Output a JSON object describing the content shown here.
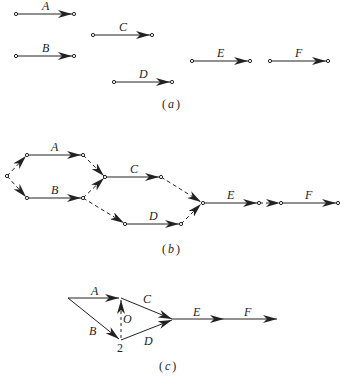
{
  "panel_a": {
    "caption_open": "(",
    "caption_letter": "a",
    "caption_close": ")",
    "activities": [
      {
        "label": "A"
      },
      {
        "label": "B"
      },
      {
        "label": "C"
      },
      {
        "label": "D"
      },
      {
        "label": "E"
      },
      {
        "label": "F"
      }
    ]
  },
  "panel_b": {
    "caption_open": "(",
    "caption_letter": "b",
    "caption_close": ")",
    "activities": [
      {
        "label": "A"
      },
      {
        "label": "B"
      },
      {
        "label": "C"
      },
      {
        "label": "D"
      },
      {
        "label": "E"
      },
      {
        "label": "F"
      }
    ]
  },
  "panel_c": {
    "caption_open": "(",
    "caption_letter": "c",
    "caption_close": ")",
    "activities": [
      {
        "label": "A"
      },
      {
        "label": "B"
      },
      {
        "label": "C"
      },
      {
        "label": "D"
      },
      {
        "label": "E"
      },
      {
        "label": "F"
      }
    ],
    "dummy_label": "O",
    "node_label": "2"
  },
  "colors": {
    "stroke": "#222222",
    "background": "#ffffff"
  }
}
